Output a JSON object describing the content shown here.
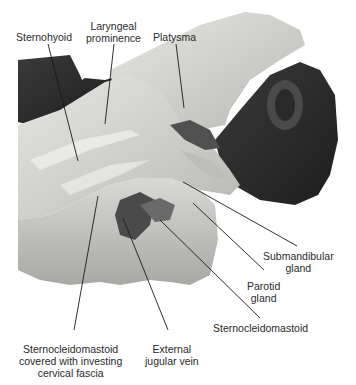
{
  "figure": {
    "labels": {
      "sternohyoid": "Sternohyoid",
      "laryngeal_prominence": [
        "Laryngeal",
        "prominence"
      ],
      "platysma": "Platysma",
      "submandibular_gland": [
        "Submandibular",
        "gland"
      ],
      "parotid_gland": [
        "Parotid",
        "gland"
      ],
      "sternocleidomastoid": "Sternocleidomastoid",
      "sternocleidomastoid_covered": [
        "Sternocleidomastoid",
        "covered with investing",
        "cervical fascia"
      ],
      "external_jugular_vein": [
        "External",
        "jugular vein"
      ]
    }
  }
}
